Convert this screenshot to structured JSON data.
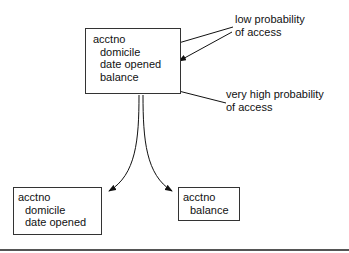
{
  "diagram": {
    "top_box": {
      "lines": [
        "acctno",
        "domicile",
        "date opened",
        "balance"
      ]
    },
    "left_box": {
      "lines": [
        "acctno",
        "domicile",
        "date opened"
      ]
    },
    "right_box": {
      "lines": [
        "acctno",
        "balance"
      ]
    },
    "annotations": {
      "low": [
        "low probability",
        "of access"
      ],
      "high": [
        "very high probability",
        "of access"
      ]
    }
  }
}
